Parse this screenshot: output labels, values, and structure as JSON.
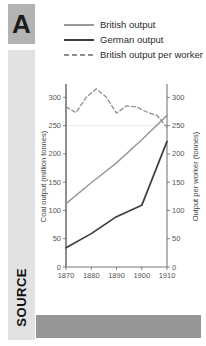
{
  "rail": {
    "badge_label": "A",
    "source_label": "SOURCE"
  },
  "legend": {
    "items": [
      {
        "label": "British output",
        "color": "#9a9a9a",
        "style": "solid"
      },
      {
        "label": "German output",
        "color": "#3d3d3d",
        "style": "solid"
      },
      {
        "label": "British output per worker",
        "color": "#8f8f8f",
        "style": "dashed"
      }
    ]
  },
  "chart_data": {
    "type": "line",
    "title": "",
    "xlabel": "",
    "ylabel": "Coal output (million tonnes)",
    "y2label": "Output per worker (tonnes)",
    "x": [
      1870,
      1880,
      1890,
      1900,
      1910
    ],
    "xlim": [
      1870,
      1910
    ],
    "xticks": [
      1870,
      1880,
      1890,
      1900,
      1910
    ],
    "ylim": [
      0,
      320
    ],
    "yticks": [
      0,
      50,
      100,
      150,
      200,
      250,
      300
    ],
    "y2lim": [
      0,
      320
    ],
    "y2ticks": [
      0,
      50,
      100,
      150,
      200,
      250,
      300
    ],
    "grid": false,
    "legend_position": "top",
    "series": [
      {
        "name": "British output",
        "axis": "left",
        "color": "#9a9a9a",
        "style": "solid",
        "x": [
          1870,
          1880,
          1890,
          1900,
          1910
        ],
        "values": [
          112,
          149,
          184,
          225,
          268
        ]
      },
      {
        "name": "German output",
        "axis": "left",
        "color": "#3d3d3d",
        "style": "solid",
        "x": [
          1870,
          1880,
          1890,
          1900,
          1910
        ],
        "values": [
          34,
          59,
          89,
          109,
          222
        ]
      },
      {
        "name": "British output per worker",
        "axis": "right",
        "color": "#8f8f8f",
        "style": "dashed",
        "x": [
          1870,
          1874,
          1878,
          1882,
          1886,
          1890,
          1894,
          1898,
          1902,
          1906,
          1910
        ],
        "values": [
          283,
          273,
          300,
          315,
          300,
          272,
          285,
          283,
          274,
          268,
          247
        ]
      }
    ]
  }
}
